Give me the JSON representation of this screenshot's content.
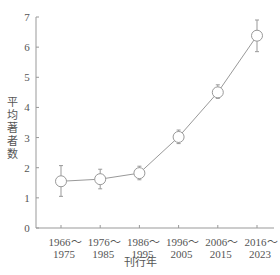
{
  "chart_data": {
    "type": "line",
    "title": "",
    "xlabel": "刊行年",
    "ylabel": "平均著者数",
    "ylim": [
      0,
      7
    ],
    "yticks": [
      0,
      1,
      2,
      3,
      4,
      5,
      6,
      7
    ],
    "grid": false,
    "legend": null,
    "categories": [
      [
        "1966～",
        "1975"
      ],
      [
        "1976～",
        "1985"
      ],
      [
        "1986～",
        "1995"
      ],
      [
        "1996～",
        "2005"
      ],
      [
        "2006～",
        "2015"
      ],
      [
        "2016～",
        "2023"
      ]
    ],
    "series": [
      {
        "name": "平均著者数",
        "values": [
          1.55,
          1.62,
          1.82,
          3.02,
          4.5,
          6.38
        ],
        "error_low": [
          1.05,
          1.3,
          1.6,
          2.8,
          4.3,
          5.85
        ],
        "error_high": [
          2.07,
          1.95,
          2.05,
          3.25,
          4.75,
          6.9
        ],
        "marker": "open-circle",
        "color": "#888888"
      }
    ]
  },
  "colors": {
    "axis": "#999999",
    "line": "#999999",
    "marker_fill": "#ffffff",
    "text": "#555555"
  }
}
